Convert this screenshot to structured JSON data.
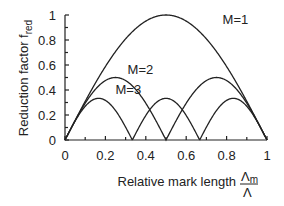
{
  "chart_data": {
    "type": "line",
    "title": "",
    "xlabel": "Relative mark length Λm/Λ",
    "xlabel_main": "Relative mark length",
    "xlabel_frac_num": "Λ",
    "xlabel_frac_num_sub": "m",
    "xlabel_frac_den": "Λ",
    "ylabel": "Reduction factor f_red",
    "ylabel_main": "Reduction factor f",
    "ylabel_sub": "red",
    "xlim": [
      0,
      1
    ],
    "ylim": [
      0,
      1
    ],
    "xticks": [
      "0",
      "0.2",
      "0.4",
      "0.6",
      "0.8",
      "1"
    ],
    "yticks": [
      "0",
      "0.2",
      "0.4",
      "0.6",
      "0.8",
      "1"
    ],
    "grid": false,
    "series": [
      {
        "name": "M=1",
        "label_pos": [
          0.78,
          0.93
        ],
        "formula": "|sin(pi*x)|/1",
        "x": [
          0,
          0.1,
          0.2,
          0.3,
          0.4,
          0.5,
          0.6,
          0.7,
          0.8,
          0.9,
          1.0
        ],
        "values": [
          0,
          0.31,
          0.59,
          0.81,
          0.95,
          1.0,
          0.95,
          0.81,
          0.59,
          0.31,
          0
        ]
      },
      {
        "name": "M=2",
        "label_pos": [
          0.31,
          0.53
        ],
        "formula": "|sin(2*pi*x)|/2",
        "x": [
          0,
          0.125,
          0.25,
          0.375,
          0.5,
          0.625,
          0.75,
          0.875,
          1.0
        ],
        "values": [
          0,
          0.35,
          0.5,
          0.35,
          0,
          0.35,
          0.5,
          0.35,
          0
        ]
      },
      {
        "name": "M=3",
        "label_pos": [
          0.25,
          0.37
        ],
        "formula": "|sin(3*pi*x)|/3",
        "x": [
          0,
          0.0833,
          0.1667,
          0.25,
          0.3333,
          0.4167,
          0.5,
          0.5833,
          0.6667,
          0.75,
          0.8333,
          0.9167,
          1.0
        ],
        "values": [
          0,
          0.24,
          0.333,
          0.24,
          0,
          0.24,
          0.333,
          0.24,
          0,
          0.24,
          0.333,
          0.24,
          0
        ]
      }
    ]
  }
}
